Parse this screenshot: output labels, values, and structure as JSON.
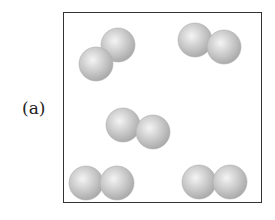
{
  "figure": {
    "label": "(a)",
    "box": {
      "x": 63,
      "y": 12,
      "width": 199,
      "height": 191
    },
    "sphere_radius": 17,
    "sphere_color": "#c8c8c8",
    "molecules": [
      {
        "name": "molecule-top-left",
        "atoms": [
          {
            "cx": 118,
            "cy": 45
          },
          {
            "cx": 96,
            "cy": 64
          }
        ]
      },
      {
        "name": "molecule-top-right",
        "atoms": [
          {
            "cx": 195,
            "cy": 40
          },
          {
            "cx": 224,
            "cy": 47
          }
        ]
      },
      {
        "name": "molecule-center",
        "atoms": [
          {
            "cx": 123,
            "cy": 125
          },
          {
            "cx": 153,
            "cy": 132
          }
        ]
      },
      {
        "name": "molecule-bottom-left",
        "atoms": [
          {
            "cx": 86,
            "cy": 183
          },
          {
            "cx": 117,
            "cy": 183
          }
        ]
      },
      {
        "name": "molecule-bottom-right",
        "atoms": [
          {
            "cx": 199,
            "cy": 182
          },
          {
            "cx": 230,
            "cy": 182
          }
        ]
      }
    ]
  }
}
